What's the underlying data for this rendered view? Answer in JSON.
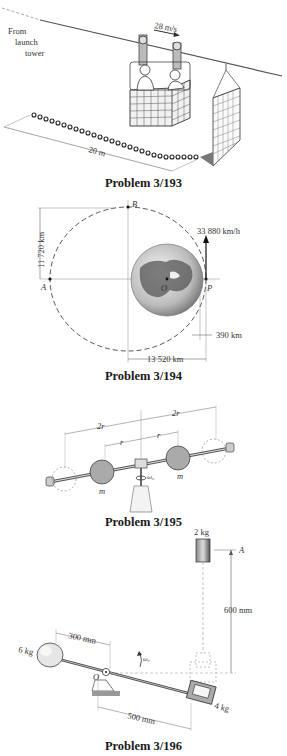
{
  "figures": [
    {
      "id": "3/193",
      "caption": "Problem 3/193",
      "labels": {
        "from_tower_1": "From",
        "from_tower_2": "launch",
        "from_tower_3": "tower",
        "speed": "28 m/s",
        "chain_length": "20 m"
      }
    },
    {
      "id": "3/194",
      "caption": "Problem 3/194",
      "labels": {
        "point_b": "B",
        "point_a": "A",
        "point_o": "O",
        "point_p": "P",
        "vertical_dim": "11 720 km",
        "velocity": "33 880 km/h",
        "altitude": "390 km",
        "horizontal_dim": "13 520 km"
      }
    },
    {
      "id": "3/195",
      "caption": "Problem 3/195",
      "labels": {
        "outer_left": "2r",
        "outer_right": "2r",
        "inner_left": "r",
        "inner_right": "r",
        "mass_left": "m",
        "mass_right": "m",
        "omega": "ω₀"
      }
    },
    {
      "id": "3/196",
      "caption": "Problem 3/196",
      "labels": {
        "top_mass": "2 kg",
        "point_a": "A",
        "height": "600 mm",
        "left_arm": "300 mm",
        "left_mass": "6 kg",
        "pivot": "O",
        "omega": "ω₀",
        "right_arm": "500 mm",
        "right_mass": "4 kg"
      }
    }
  ]
}
